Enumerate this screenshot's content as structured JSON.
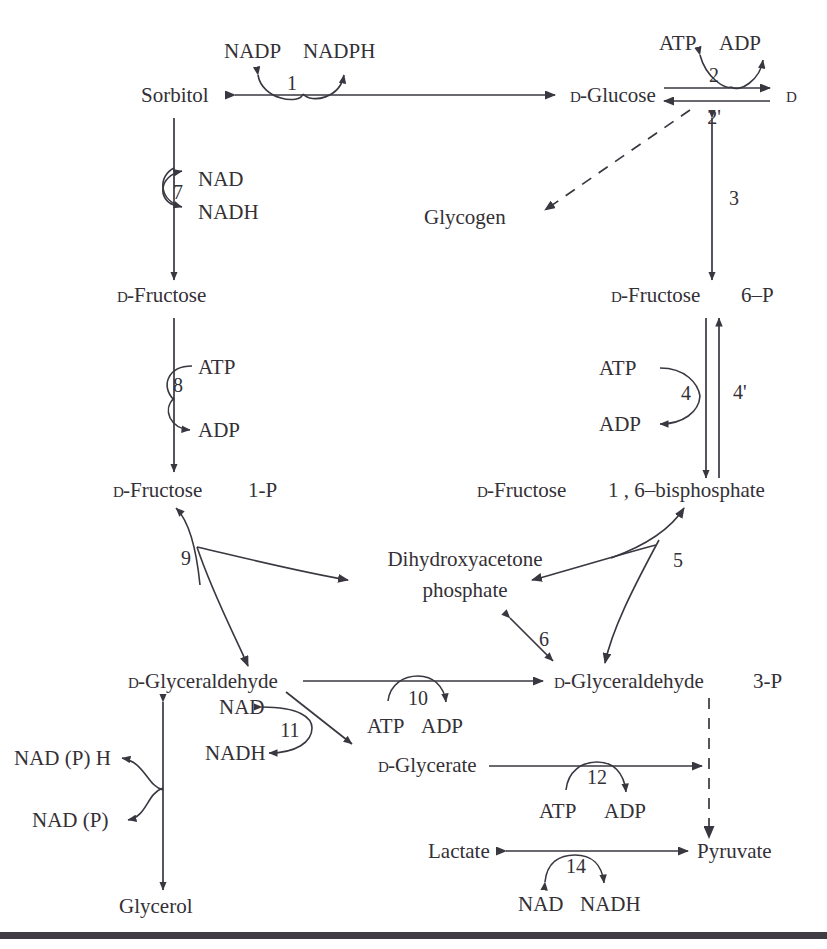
{
  "figure": {
    "type": "metabolic-pathway-diagram",
    "background_color": "#ffffff",
    "ink_color": "#333036"
  },
  "metabolites": {
    "sorbitol": "Sorbitol",
    "d_glucose": "D-Glucose",
    "d_glucose_6p_name": "D-Glucose",
    "d_glucose_6p_suffix": "6–P",
    "glycogen": "Glycogen",
    "d_fructose_left": "D-Fructose",
    "d_fructose_6p_name": "D-Fructose",
    "d_fructose_6p_suffix": "6–P",
    "d_fructose_1p_name": "D-Fructose",
    "d_fructose_1p_suffix": "1-P",
    "d_fructose_16bp_name": "D-Fructose",
    "d_fructose_16bp_suffix": "1 , 6–bisphosphate",
    "dhap_line1": "Dihydroxyacetone",
    "dhap_line2": "phosphate",
    "d_glyceraldehyde": "D-Glyceraldehyde",
    "d_glyceraldehyde_3p_name": "D-Glyceraldehyde",
    "d_glyceraldehyde_3p_suffix": "3-P",
    "d_glycerate": "D-Glycerate",
    "lactate": "Lactate",
    "pyruvate": "Pyruvate",
    "glycerol": "Glycerol"
  },
  "smallcap_prefix": "D",
  "cofactors": {
    "nadp": "NADP",
    "nadph": "NADPH",
    "atp": "ATP",
    "adp": "ADP",
    "nad": "NAD",
    "nadh": "NADH",
    "nad_p_h": "NAD (P) H",
    "nad_p": "NAD (P)"
  },
  "reactions": [
    {
      "id": "1",
      "label": "1",
      "substrate": "Sorbitol",
      "product": "D-Glucose",
      "cosubstrate": "NADP",
      "coproduct": "NADPH"
    },
    {
      "id": "2",
      "label": "2",
      "substrate": "D-Glucose",
      "product": "D-Glucose 6-P",
      "cosubstrate": "ATP",
      "coproduct": "ADP"
    },
    {
      "id": "2p",
      "label": "2'",
      "substrate": "D-Glucose 6-P",
      "product": "D-Glucose",
      "cosubstrate": "",
      "coproduct": ""
    },
    {
      "id": "3",
      "label": "3",
      "substrate": "D-Glucose 6-P",
      "product": "D-Fructose 6-P",
      "cosubstrate": "",
      "coproduct": ""
    },
    {
      "id": "4",
      "label": "4",
      "substrate": "D-Fructose 6-P",
      "product": "D-Fructose 1,6-bisphosphate",
      "cosubstrate": "ATP",
      "coproduct": "ADP"
    },
    {
      "id": "4p",
      "label": "4'",
      "substrate": "D-Fructose 1,6-bisphosphate",
      "product": "D-Fructose 6-P",
      "cosubstrate": "",
      "coproduct": ""
    },
    {
      "id": "5",
      "label": "5",
      "substrate": "D-Fructose 1,6-bisphosphate",
      "product": "Dihydroxyacetone phosphate + D-Glyceraldehyde 3-P",
      "cosubstrate": "",
      "coproduct": ""
    },
    {
      "id": "6",
      "label": "6",
      "substrate": "Dihydroxyacetone phosphate",
      "product": "D-Glyceraldehyde 3-P",
      "cosubstrate": "",
      "coproduct": ""
    },
    {
      "id": "7",
      "label": "7",
      "substrate": "Sorbitol",
      "product": "D-Fructose",
      "cosubstrate": "NAD",
      "coproduct": "NADH"
    },
    {
      "id": "8",
      "label": "8",
      "substrate": "D-Fructose",
      "product": "D-Fructose 1-P",
      "cosubstrate": "ATP",
      "coproduct": "ADP"
    },
    {
      "id": "9",
      "label": "9",
      "substrate": "D-Fructose 1-P",
      "product": "Dihydroxyacetone phosphate + D-Glyceraldehyde",
      "cosubstrate": "",
      "coproduct": ""
    },
    {
      "id": "10",
      "label": "10",
      "substrate": "D-Glyceraldehyde",
      "product": "D-Glyceraldehyde 3-P",
      "cosubstrate": "ATP",
      "coproduct": "ADP"
    },
    {
      "id": "11",
      "label": "11",
      "substrate": "D-Glyceraldehyde",
      "product": "D-Glycerate",
      "cosubstrate": "NAD",
      "coproduct": "NADH"
    },
    {
      "id": "12",
      "label": "12",
      "substrate": "D-Glycerate",
      "product": "D-Glycerate 3-P",
      "cosubstrate": "ATP",
      "coproduct": "ADP"
    },
    {
      "id": "14",
      "label": "14",
      "substrate": "Pyruvate",
      "product": "Lactate",
      "cosubstrate": "NAD",
      "coproduct": "NADH"
    }
  ],
  "reaction_labels": {
    "r1": "1",
    "r2": "2",
    "r2p": "2'",
    "r3": "3",
    "r4": "4",
    "r4p": "4'",
    "r5": "5",
    "r6": "6",
    "r7": "7",
    "r8": "8",
    "r9": "9",
    "r10": "10",
    "r11": "11",
    "r12": "12",
    "r14": "14"
  },
  "cofactor_instances": {
    "nadp_r1": "NADP",
    "nadph_r1": "NADPH",
    "atp_r2": "ATP",
    "adp_r2": "ADP",
    "nad_r7": "NAD",
    "nadh_r7": "NADH",
    "atp_r8": "ATP",
    "adp_r8": "ADP",
    "atp_r4": "ATP",
    "adp_r4": "ADP",
    "nad_r11": "NAD",
    "nadh_r11": "NADH",
    "atp_r10": "ATP",
    "adp_r10": "ADP",
    "atp_r12": "ATP",
    "adp_r12": "ADP",
    "nad_r14": "NAD",
    "nadh_r14": "NADH",
    "nadph_glycerol": "NAD (P) H",
    "nadp_glycerol": "NAD (P)"
  }
}
